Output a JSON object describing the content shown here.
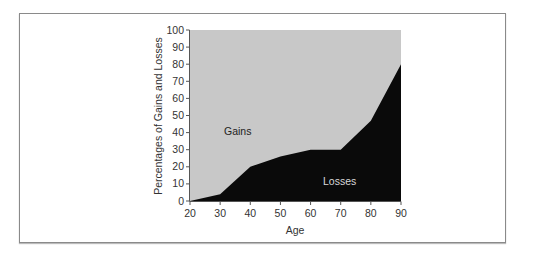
{
  "chart_data": {
    "type": "area",
    "title": "",
    "xlabel": "Age",
    "ylabel": "Percentages of Gains and Losses",
    "x": [
      20,
      30,
      40,
      50,
      60,
      70,
      80,
      90
    ],
    "series": [
      {
        "name": "Losses",
        "values": [
          0,
          4,
          20,
          26,
          30,
          30,
          47,
          80
        ],
        "color": "#0a0a0a"
      },
      {
        "name": "Gains",
        "values": [
          100,
          96,
          80,
          74,
          70,
          70,
          53,
          20
        ],
        "color": "#c8c8c8"
      }
    ],
    "stacked": true,
    "xlim": [
      20,
      90
    ],
    "ylim": [
      0,
      100
    ],
    "xticks": [
      "20",
      "30",
      "40",
      "50",
      "60",
      "70",
      "80",
      "90"
    ],
    "yticks": [
      "0",
      "10",
      "20",
      "30",
      "40",
      "50",
      "60",
      "70",
      "80",
      "90",
      "100"
    ],
    "annotations": [
      {
        "text": "Gains",
        "x": 32,
        "y": 40
      },
      {
        "text": "Losses",
        "x": 65,
        "y": 12
      }
    ],
    "grid": false,
    "legend": "none"
  },
  "labels": {
    "gains": "Gains",
    "losses": "Losses",
    "xlabel": "Age",
    "ylabel": "Percentages of Gains and Losses"
  }
}
